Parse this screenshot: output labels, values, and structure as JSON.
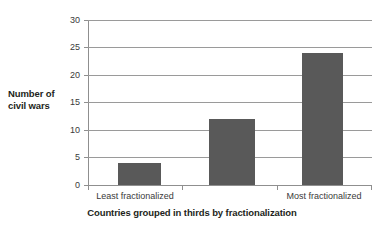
{
  "chart_data": {
    "type": "bar",
    "title": "",
    "subtitle": "",
    "categories": [
      "Least fractionalized",
      "",
      "Most fractionalized"
    ],
    "values": [
      4,
      12,
      24
    ],
    "xlabel": "Countries grouped in thirds by fractionalization",
    "ylabel": "Number of civil wars",
    "ylim": [
      0,
      30
    ],
    "ytick_labels": [
      "0",
      "5",
      "10",
      "15",
      "20",
      "25",
      "30"
    ],
    "ytick_values": [
      0,
      5,
      10,
      15,
      20,
      25,
      30
    ],
    "grid": true,
    "legend": "none",
    "bar_color": "#595959",
    "gridline_color": "#9a9a9a",
    "background_color": "#ffffff"
  },
  "axis": {
    "y_title_line1": "Number of",
    "y_title_line2": "civil wars",
    "x_title": "Countries grouped in thirds by fractionalization"
  }
}
